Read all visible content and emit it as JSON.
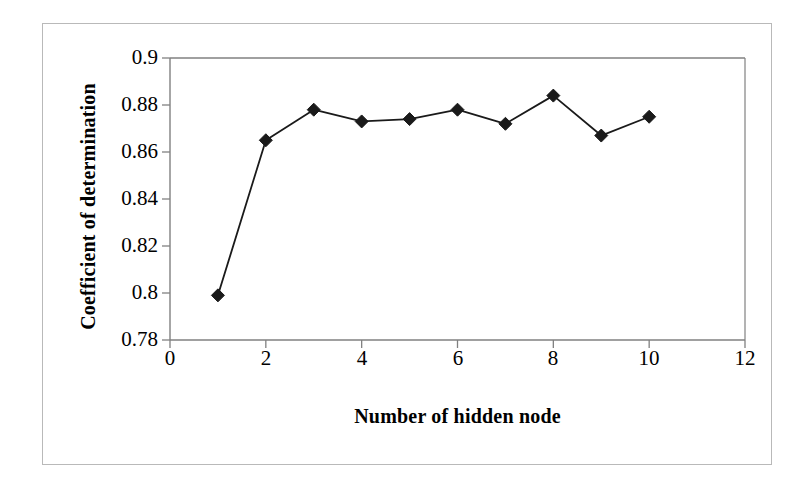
{
  "chart_data": {
    "type": "line",
    "title": "",
    "xlabel": "Number of hidden node",
    "ylabel": "Coefficient of determination",
    "x": [
      1,
      2,
      3,
      4,
      5,
      6,
      7,
      8,
      9,
      10
    ],
    "values": [
      0.799,
      0.865,
      0.878,
      0.873,
      0.874,
      0.878,
      0.872,
      0.884,
      0.867,
      0.875
    ],
    "series": [
      {
        "name": "Coefficient of determination",
        "values": [
          0.799,
          0.865,
          0.878,
          0.873,
          0.874,
          0.878,
          0.872,
          0.884,
          0.867,
          0.875
        ]
      }
    ],
    "xlim": [
      0,
      12
    ],
    "ylim": [
      0.78,
      0.9
    ],
    "xticks": [
      "0",
      "2",
      "4",
      "6",
      "8",
      "10",
      "12"
    ],
    "xtick_values": [
      0,
      2,
      4,
      6,
      8,
      10,
      12
    ],
    "yticks": [
      "0.9",
      "0.88",
      "0.86",
      "0.84",
      "0.82",
      "0.8",
      "0.78"
    ],
    "ytick_values": [
      0.9,
      0.88,
      0.86,
      0.84,
      0.82,
      0.8,
      0.78
    ],
    "grid": false,
    "legend": "none",
    "marker": "diamond",
    "line_color": "#1a1a1a",
    "marker_color": "#1a1a1a",
    "axis_color": "#808080",
    "background_color": "#ffffff",
    "frame_color": "#b9b9b9"
  }
}
